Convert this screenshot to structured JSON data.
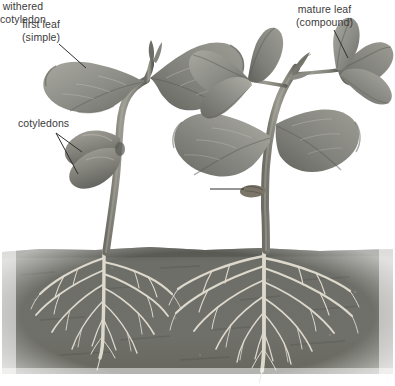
{
  "figure": {
    "width": 395,
    "height": 386,
    "background_color": "#ffffff"
  },
  "labels": [
    {
      "id": "first-leaf",
      "line1": "first leaf",
      "line2": "(simple)",
      "text": "first leaf\n(simple)",
      "x": 22,
      "y": 18,
      "color": "#3b3b3b",
      "leader": "single-line-down-right"
    },
    {
      "id": "cotyledons",
      "line1": "cotyledons",
      "line2": "",
      "text": "cotyledons",
      "x": 18,
      "y": 117,
      "color": "#3b3b3b",
      "leader": "two-pronged-down-right"
    },
    {
      "id": "mature-leaf",
      "line1": "mature leaf",
      "line2": "(compound)",
      "text": "mature leaf\n(compound)",
      "x": 296,
      "y": 3,
      "color": "#3b3b3b",
      "leader": "single-line-down"
    },
    {
      "id": "withered-cotyledon",
      "line1": "withered",
      "line2": "cotyledon",
      "text": "withered\ncotyledon",
      "x": 156,
      "y": 182,
      "color": "#3b3b3b",
      "leader": "horizontal-right"
    }
  ],
  "soil": {
    "top_y": 247,
    "bottom_y": 375,
    "fill_color": "#6e6e68",
    "shadow_color": "#4a4a46"
  },
  "plants": [
    {
      "id": "young-seedling",
      "position": "left",
      "stage": "first-leaf stage",
      "leaf_type": "simple",
      "leaf_count": 2,
      "has_cotyledons": true,
      "stem_color": "#8a8a80",
      "leaf_color": "#8c8c86",
      "root_color": "#ded9cd"
    },
    {
      "id": "mature-seedling",
      "position": "right",
      "stage": "mature-leaf stage",
      "leaf_type": "compound",
      "leaf_count": 7,
      "has_cotyledons": false,
      "withered_cotyledon": true,
      "stem_color": "#8a8a80",
      "leaf_color": "#7f7f79",
      "root_color": "#ded9cd"
    }
  ],
  "colors": {
    "background": "#ffffff",
    "soil": "#6e6e68",
    "soil_dark": "#4a4a46",
    "leaf_dark": "#6f6f69",
    "leaf_mid": "#8c8c86",
    "leaf_light": "#a9a9a2",
    "stem": "#8a8a80",
    "root": "#ded9cd",
    "label_text": "#3b3b3b",
    "leader_line": "#2e2e2e"
  }
}
